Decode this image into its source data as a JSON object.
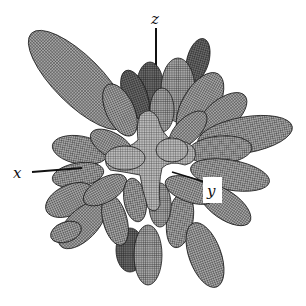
{
  "figure": {
    "type": "3d-radiation-pattern-mesh",
    "background": "#ffffff",
    "mesh_color": "#2a2a2a",
    "fill_light": "#a9a9a9",
    "fill_dark": "#5a5a5a"
  },
  "axes": {
    "x": {
      "label": "x"
    },
    "y": {
      "label": "y"
    },
    "z": {
      "label": "z"
    }
  }
}
